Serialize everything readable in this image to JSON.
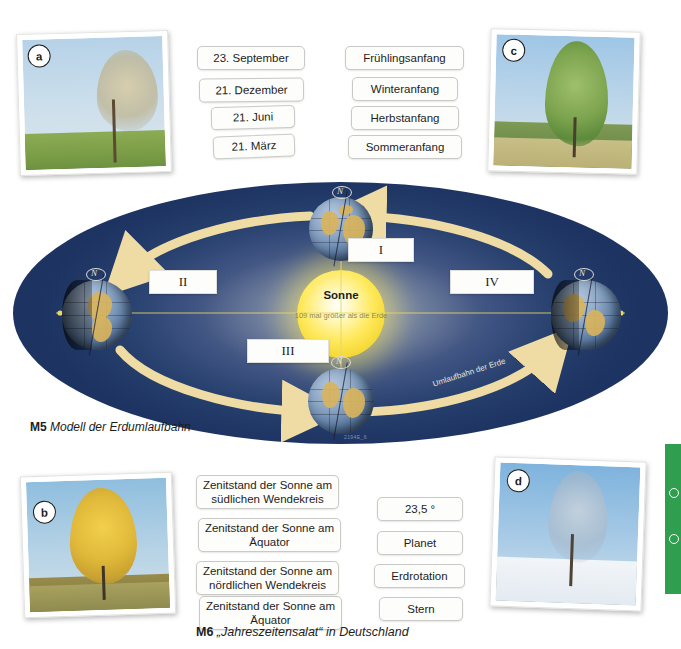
{
  "page": {
    "language": "de"
  },
  "date_chips": [
    {
      "label": "23. September"
    },
    {
      "label": "21. Dezember"
    },
    {
      "label": "21. Juni"
    },
    {
      "label": "21. März"
    }
  ],
  "season_chips": [
    {
      "label": "Frühlingsanfang"
    },
    {
      "label": "Winteranfang"
    },
    {
      "label": "Herbstanfang"
    },
    {
      "label": "Sommeranfang"
    }
  ],
  "zenith_chips": [
    {
      "label": "Zenitstand der Sonne am südlichen Wendekreis"
    },
    {
      "label": "Zenitstand der Sonne am Äquator"
    },
    {
      "label": "Zenitstand der Sonne am nördlichen Wendekreis"
    },
    {
      "label": "Zenitstand der Sonne am Äquator"
    }
  ],
  "term_chips": [
    {
      "label": "23,5 °"
    },
    {
      "label": "Planet"
    },
    {
      "label": "Erdrotation"
    },
    {
      "label": "Stern"
    }
  ],
  "photos": [
    {
      "badge": "a",
      "season": "Frühling",
      "description": "Birke mit hellem Austrieb auf grüner Wiese"
    },
    {
      "badge": "b",
      "season": "Herbst",
      "description": "Birke mit goldgelbem Laub"
    },
    {
      "badge": "c",
      "season": "Sommer",
      "description": "Birke in vollem grünen Laub"
    },
    {
      "badge": "d",
      "season": "Winter",
      "description": "Kahle Birke auf Schnee"
    }
  ],
  "orbit": {
    "sun_label": "Sonne",
    "sun_sublabel": "109 mal größer als die Erde",
    "orbit_path_label": "Umlaufbahn der Erde",
    "axis_marker": "N",
    "tiny_id": "2194E_6",
    "positions": [
      {
        "numeral": "I",
        "place": "top"
      },
      {
        "numeral": "II",
        "place": "left"
      },
      {
        "numeral": "III",
        "place": "bottom"
      },
      {
        "numeral": "IV",
        "place": "right"
      }
    ]
  },
  "captions": {
    "m5_number": "M5",
    "m5_text": "Modell der Erdumlaufbahn",
    "m6_number": "M6",
    "m6_text": "„Jahreszeitensalat“ in Deutschland"
  },
  "colors": {
    "orbit_background_dark": "#1d3361",
    "orbit_background_light": "#7e8ca8",
    "sun_yellow": "#ffe95c",
    "arrow_cream": "#f0dca6",
    "chip_background": "#fdfdfb",
    "chip_border": "#c9c9c5",
    "sidebar_green": "#2f9e4f",
    "text_dark": "#1d1d1b"
  }
}
